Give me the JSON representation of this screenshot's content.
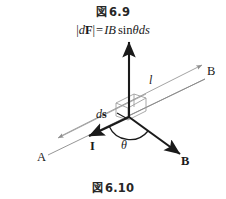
{
  "figure": {
    "caption_top": {
      "glyph": "図",
      "glyph_name": "zu-figure-kanji",
      "number": "6.9",
      "full": "図 6.9"
    },
    "caption_bottom": {
      "glyph": "図",
      "glyph_name": "zu-figure-kanji",
      "number": "6.10",
      "full": "図 6.10"
    },
    "formula": {
      "full": "|dF| = IB sin θds",
      "parts": {
        "bar_open": "|",
        "d": "d",
        "F_bold": "F",
        "bar_close": "|",
        "equals": "=",
        "I": "I",
        "B": "B",
        "sin": "sin",
        "theta": "θ",
        "ds": "ds"
      }
    },
    "labels": {
      "field_line": "l",
      "field_line_end": "B",
      "conductor_start": "A",
      "current": "I",
      "angle": "θ",
      "field_vector": "B",
      "ds_prefix": "d",
      "ds_vector": "s"
    },
    "colors": {
      "background": "#ffffff",
      "ink": "#1a1a1a",
      "thin_line": "#9a9a9a",
      "box_line": "#8f8f8f",
      "caption": "#262626"
    }
  }
}
